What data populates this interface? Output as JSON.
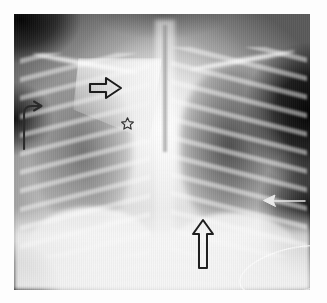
{
  "figure": {
    "type": "radiograph",
    "modality": "X-ray",
    "view": "frontal chest (AP)",
    "background_color": "#fdfdfd",
    "plate_bounds": {
      "x": 14,
      "y": 14,
      "width": 296,
      "height": 276
    },
    "caption": ""
  },
  "anatomy": {
    "regions": [
      {
        "name": "right-lung-field",
        "label": "",
        "density": "aerated"
      },
      {
        "name": "left-lung-field",
        "label": "",
        "density": "hyperlucent"
      },
      {
        "name": "mediastinum",
        "label": "",
        "density": "opaque"
      },
      {
        "name": "thymus",
        "label": "",
        "density": "opaque"
      },
      {
        "name": "spine",
        "label": "",
        "density": "opaque"
      },
      {
        "name": "trachea",
        "label": "",
        "density": "lucent"
      },
      {
        "name": "clavicle-right",
        "label": "",
        "density": "opaque"
      },
      {
        "name": "clavicle-left",
        "label": "",
        "density": "opaque"
      },
      {
        "name": "diaphragm",
        "label": "",
        "density": "opaque"
      },
      {
        "name": "abdomen",
        "label": "",
        "density": "opaque"
      }
    ]
  },
  "annotations": [
    {
      "id": "sail-arrow",
      "name": "hollow-right-arrow-icon",
      "shape": "hollow-arrow",
      "direction": "right",
      "color": "#1c1c1c",
      "fill": "none",
      "label": "",
      "position": {
        "x": 89,
        "y": 76
      },
      "size": {
        "width": 32,
        "height": 22
      }
    },
    {
      "id": "hook-arrow",
      "name": "hooked-arrow-icon",
      "shape": "hooked-arrow",
      "direction": "up-then-right",
      "color": "#2b2b2b",
      "fill": "none",
      "label": "",
      "position": {
        "x": 20,
        "y": 100
      },
      "size": {
        "width": 24,
        "height": 48
      }
    },
    {
      "id": "star-marker",
      "name": "star-marker-icon",
      "shape": "hollow-star",
      "direction": "",
      "color": "#2f2f2f",
      "fill": "none",
      "label": "",
      "position": {
        "x": 121,
        "y": 117
      },
      "size": {
        "width": 12,
        "height": 12
      }
    },
    {
      "id": "diaphragm-arrow",
      "name": "hollow-up-arrow-icon",
      "shape": "hollow-arrow",
      "direction": "up",
      "color": "#1f1f1f",
      "fill": "none",
      "label": "",
      "position": {
        "x": 191,
        "y": 219
      },
      "size": {
        "width": 22,
        "height": 48
      }
    },
    {
      "id": "lateral-arrow",
      "name": "thin-left-arrow-icon",
      "shape": "thin-arrow",
      "direction": "left",
      "color": "#e8e8e8",
      "fill": "none",
      "label": "",
      "position": {
        "x": 262,
        "y": 193
      },
      "size": {
        "width": 40,
        "height": 14
      }
    }
  ],
  "devices": [
    {
      "id": "catheter-loop",
      "name": "catheter-tubing",
      "shape": "ellipse-outline",
      "color": "#ffffff",
      "label": "",
      "position": {
        "x": 238,
        "y": 248
      },
      "size": {
        "width": 106,
        "height": 44
      }
    }
  ],
  "palette": {
    "mount": "#fdfdfd",
    "plate_dark": "#0a0a0a",
    "plate_mid": "#9c9c9c",
    "plate_bright": "#ffffff",
    "marker_dark": "#1c1c1c",
    "marker_light": "#e8e8e8"
  }
}
